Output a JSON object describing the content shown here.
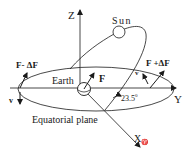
{
  "diagram": {
    "labels": {
      "z_axis": "Z",
      "y_axis": "Y",
      "x_axis": "X",
      "x_axis_symbol": "♈",
      "sun": "Sun",
      "earth": "Earth",
      "plane": "Equatorial plane",
      "force": "F",
      "force_minus": "F- ΔF",
      "force_plus": "F +ΔF",
      "velocity_left": "v",
      "velocity_right": "v",
      "angle": "23.5",
      "angle_unit": "0"
    },
    "colors": {
      "stroke": "#1a1a1a",
      "background": "#ffffff"
    }
  }
}
